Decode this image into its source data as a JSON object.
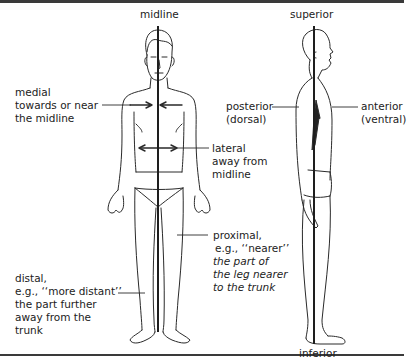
{
  "diagram": {
    "type": "anatomical-directional-terms",
    "views": [
      "anterior-view",
      "lateral-view"
    ],
    "labels": {
      "midline": "midline",
      "superior": "superior",
      "inferior": "inferior",
      "medial": {
        "term": "medial",
        "desc": "towards or near",
        "desc2": "the midline"
      },
      "lateral": {
        "term": "lateral",
        "desc": "away from",
        "desc2": "midline"
      },
      "posterior": {
        "term": "posterior",
        "alt": "(dorsal)"
      },
      "anterior": {
        "term": "anterior",
        "alt": "(ventral)"
      },
      "proximal": {
        "term": "proximal,",
        "eg": "e.g., ‘‘nearer’’",
        "desc": "the part of",
        "desc2": "the leg nearer",
        "desc3": "to the trunk"
      },
      "distal": {
        "term": "distal,",
        "eg": "e.g., ‘‘more distant’’",
        "desc": "the part further",
        "desc2": "away from the",
        "desc3": "trunk"
      }
    },
    "colors": {
      "line": "#2a2a2a",
      "text": "#222222",
      "rule": "#3a3a3a"
    }
  }
}
